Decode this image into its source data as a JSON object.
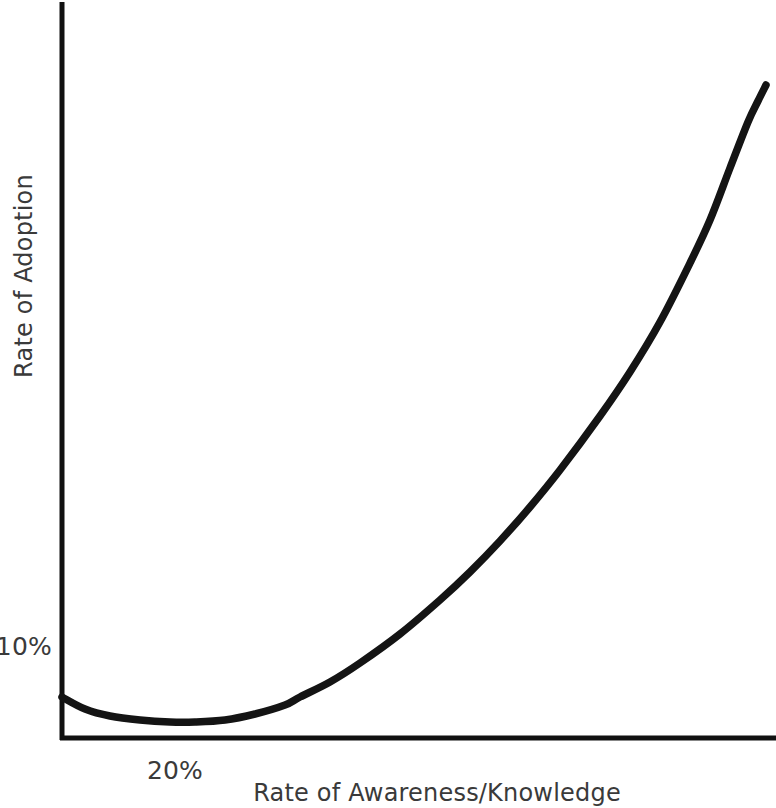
{
  "figure": {
    "background_color": "#ffffff",
    "ink_color": "#141414",
    "text_color": "#3a3a3a"
  },
  "chart_data": {
    "type": "line",
    "title": "",
    "subtitle": "",
    "xlabel": "Rate of Awareness/Knowledge",
    "ylabel": "Rate of Adoption",
    "grid": false,
    "legend": false,
    "legend_position": "none",
    "annotations": [],
    "x_ticks": [
      {
        "label": "20%",
        "value": 20
      }
    ],
    "y_ticks": [
      {
        "label": "10%",
        "value": 10
      }
    ],
    "xlim": [
      10,
      100
    ],
    "ylim": [
      0,
      100
    ],
    "axis_ticks_note": "Only one labeled tick per axis: 20% on x, 10% on y",
    "series": [
      {
        "name": "Rate of Adoption",
        "shape": "J-curve (shallow decline then steep exponential rise)",
        "x": [
          10.0,
          13.5,
          17.0,
          20.0,
          24.0,
          28.0,
          33.0,
          38.0,
          44.0,
          50.0,
          56.0,
          62.0,
          68.0,
          74.0,
          80.0,
          86.0,
          92.0,
          96.0,
          100.0
        ],
        "y": [
          6.2,
          5.4,
          4.9,
          4.8,
          5.1,
          5.8,
          7.2,
          9.2,
          12.4,
          16.2,
          20.6,
          25.8,
          32.0,
          39.4,
          48.2,
          58.6,
          71.2,
          80.8,
          91.5
        ]
      }
    ],
    "pixel_path": {
      "note": "SVG pixel coordinates tracing the drawn curve in the 776x808 canvas",
      "points": [
        [
          62,
          697
        ],
        [
          85,
          709
        ],
        [
          110,
          716
        ],
        [
          140,
          720
        ],
        [
          170,
          722
        ],
        [
          195,
          722
        ],
        [
          225,
          720
        ],
        [
          255,
          714
        ],
        [
          285,
          705
        ],
        [
          300,
          697
        ],
        [
          330,
          682
        ],
        [
          360,
          663
        ],
        [
          400,
          634
        ],
        [
          440,
          600
        ],
        [
          470,
          572
        ],
        [
          500,
          541
        ],
        [
          530,
          507
        ],
        [
          560,
          470
        ],
        [
          600,
          416
        ],
        [
          630,
          372
        ],
        [
          660,
          322
        ],
        [
          690,
          263
        ],
        [
          710,
          220
        ],
        [
          730,
          168
        ],
        [
          748,
          122
        ],
        [
          758,
          101
        ],
        [
          766,
          85
        ]
      ]
    }
  },
  "axes": {
    "y_axis": {
      "name": "vertical-axis",
      "x": 62,
      "y_top": 2,
      "y_bottom": 740
    },
    "x_axis": {
      "name": "horizontal-axis",
      "y": 738,
      "x_left": 60,
      "x_right": 776
    }
  },
  "labels": {
    "y_tick_10": "10%",
    "x_tick_20": "20%",
    "y_axis_title": "Rate of Adoption",
    "x_axis_title": "Rate of Awareness/Knowledge"
  }
}
